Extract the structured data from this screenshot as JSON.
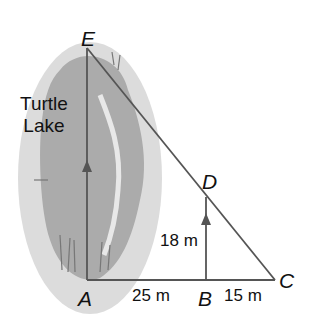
{
  "diagram": {
    "lake_name_line1": "Turtle",
    "lake_name_line2": "Lake",
    "points": {
      "E": "E",
      "A": "A",
      "B": "B",
      "C": "C",
      "D": "D"
    },
    "measurements": {
      "AB": "25 m",
      "BC": "15 m",
      "BD": "18 m"
    },
    "colors": {
      "line": "#555555",
      "lake_outer": "#d9d9d9",
      "lake_inner": "#a9a9a9",
      "text": "#111111"
    }
  }
}
